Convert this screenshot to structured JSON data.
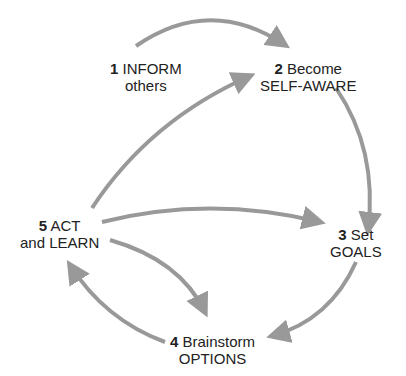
{
  "diagram": {
    "arrow_color": "#999999",
    "nodes": [
      {
        "id": 1,
        "number": "1",
        "line1": "INFORM",
        "line2": "others"
      },
      {
        "id": 2,
        "number": "2",
        "line1": "Become",
        "line2": "SELF-AWARE"
      },
      {
        "id": 3,
        "number": "3",
        "line1": "Set",
        "line2": "GOALS"
      },
      {
        "id": 4,
        "number": "4",
        "line1": "Brainstorm",
        "line2": "OPTIONS"
      },
      {
        "id": 5,
        "number": "5",
        "line1": "ACT",
        "line2": "and LEARN"
      }
    ],
    "edges": [
      {
        "from": 1,
        "to": 2
      },
      {
        "from": 2,
        "to": 3
      },
      {
        "from": 3,
        "to": 4
      },
      {
        "from": 4,
        "to": 5
      },
      {
        "from": 5,
        "to": 4
      },
      {
        "from": 5,
        "to": 3
      },
      {
        "from": 5,
        "to": 2
      }
    ]
  }
}
